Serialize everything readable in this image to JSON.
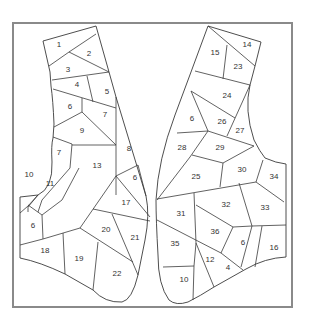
{
  "figure": {
    "frame_color": "#8a8a8a",
    "line_color": "#3a3a3a"
  },
  "left_panel": {
    "pieces": [
      {
        "label": "1",
        "x": 59,
        "y": 45
      },
      {
        "label": "2",
        "x": 89,
        "y": 54
      },
      {
        "label": "3",
        "x": 68,
        "y": 70
      },
      {
        "label": "4",
        "x": 77,
        "y": 85
      },
      {
        "label": "5",
        "x": 107,
        "y": 92
      },
      {
        "label": "6",
        "x": 70,
        "y": 107
      },
      {
        "label": "7",
        "x": 105,
        "y": 115
      },
      {
        "label": "9",
        "x": 82,
        "y": 131
      },
      {
        "label": "7",
        "x": 59,
        "y": 153
      },
      {
        "label": "8",
        "x": 129,
        "y": 149
      },
      {
        "label": "13",
        "x": 97,
        "y": 166
      },
      {
        "label": "10",
        "x": 29,
        "y": 175
      },
      {
        "label": "11",
        "x": 50,
        "y": 184
      },
      {
        "label": "6",
        "x": 135,
        "y": 178
      },
      {
        "label": "17",
        "x": 126,
        "y": 203
      },
      {
        "label": "6",
        "x": 33,
        "y": 226
      },
      {
        "label": "20",
        "x": 106,
        "y": 230
      },
      {
        "label": "21",
        "x": 135,
        "y": 238
      },
      {
        "label": "18",
        "x": 45,
        "y": 251
      },
      {
        "label": "19",
        "x": 79,
        "y": 259
      },
      {
        "label": "22",
        "x": 117,
        "y": 274
      }
    ]
  },
  "right_panel": {
    "pieces": [
      {
        "label": "14",
        "x": 247,
        "y": 45
      },
      {
        "label": "15",
        "x": 215,
        "y": 53
      },
      {
        "label": "23",
        "x": 238,
        "y": 67
      },
      {
        "label": "24",
        "x": 227,
        "y": 96
      },
      {
        "label": "6",
        "x": 192,
        "y": 119
      },
      {
        "label": "26",
        "x": 222,
        "y": 122
      },
      {
        "label": "27",
        "x": 240,
        "y": 131
      },
      {
        "label": "28",
        "x": 182,
        "y": 148
      },
      {
        "label": "29",
        "x": 220,
        "y": 148
      },
      {
        "label": "30",
        "x": 242,
        "y": 170
      },
      {
        "label": "25",
        "x": 196,
        "y": 177
      },
      {
        "label": "34",
        "x": 274,
        "y": 177
      },
      {
        "label": "32",
        "x": 226,
        "y": 205
      },
      {
        "label": "33",
        "x": 265,
        "y": 208
      },
      {
        "label": "31",
        "x": 181,
        "y": 214
      },
      {
        "label": "36",
        "x": 215,
        "y": 232
      },
      {
        "label": "6",
        "x": 243,
        "y": 243
      },
      {
        "label": "16",
        "x": 274,
        "y": 248
      },
      {
        "label": "35",
        "x": 175,
        "y": 244
      },
      {
        "label": "12",
        "x": 210,
        "y": 260
      },
      {
        "label": "4",
        "x": 228,
        "y": 268
      },
      {
        "label": "10",
        "x": 184,
        "y": 280
      }
    ]
  }
}
